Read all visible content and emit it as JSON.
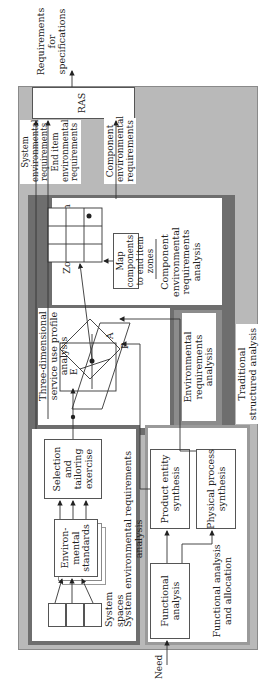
{
  "diagram": {
    "orientation": "rotated 90 degrees counter-clockwise (text reads bottom to top)",
    "inputs": {
      "need": "Need"
    },
    "outputs": {
      "requirements": "Requirements\nfor\nspecifications"
    },
    "ras": {
      "label": "RAS"
    },
    "system_env_analysis": {
      "title": "System environmental requirements analysis",
      "system_spaces": "System\nspaces",
      "env_standards": "Environ-\nmental\nstandards",
      "selection": "Selection\nand\ntailoring\nexercise"
    },
    "three_d_profile": {
      "title": "Three-dimensional\nservice use profile\nanalysis",
      "axes": {
        "e": "E",
        "a": "A",
        "p": "P"
      }
    },
    "component_analysis": {
      "zone": "Zone end item",
      "map": "Map components\nto end item zones",
      "title": "Component\nenvironmental\nrequirements\nanalysis"
    },
    "env_req_analysis": {
      "title": "Environmental\nrequirements analysis"
    },
    "traditional": {
      "title": "Traditional\nstructured analysis"
    },
    "functional": {
      "functional_analysis": "Functional\nanalysis",
      "product_entity": "Product entity\nsynthesis",
      "physical_process": "Physical process\nsynthesis",
      "allocation": "Functional analysis\nand allocation"
    },
    "flow_labels": {
      "system_env": "System\nenvironmental\nrequirements",
      "end_item_env": "End item\nenvironmental\nrequirements",
      "component_env": "Component\nenvironmental\nrequirements"
    }
  },
  "colors": {
    "outer_gray": "#b9b9b9",
    "dark_band": "#6e6e6e",
    "mid_band": "#8c8c8c",
    "box_line": "#555555"
  }
}
